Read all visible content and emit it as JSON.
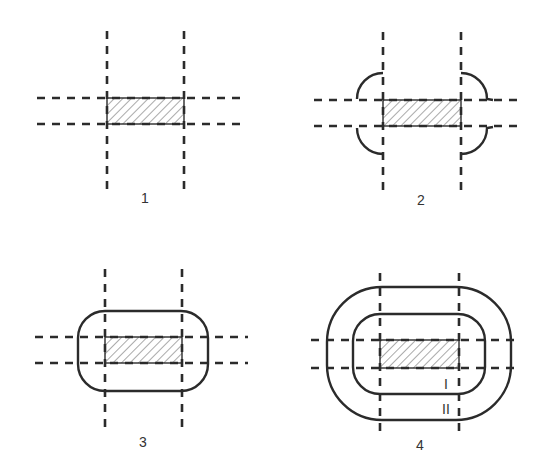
{
  "figure": {
    "panels": [
      {
        "label": "1"
      },
      {
        "label": "2"
      },
      {
        "label": "3"
      },
      {
        "label": "4",
        "zone_labels": [
          "I",
          "II"
        ]
      }
    ],
    "colors": {
      "stroke": "#2b2b2b",
      "hatch": "#555555",
      "background": "#ffffff"
    }
  }
}
